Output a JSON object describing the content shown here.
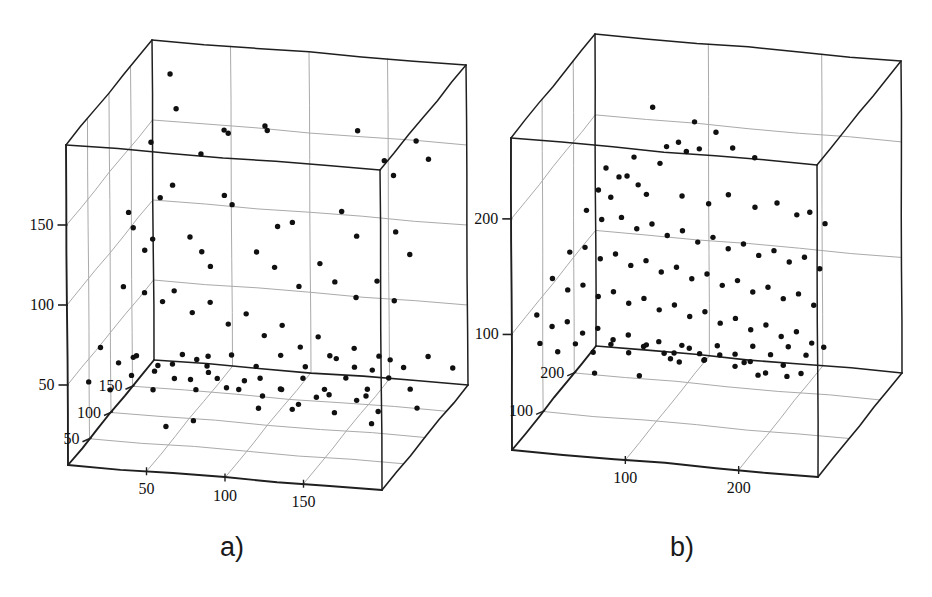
{
  "figure": {
    "background": "#ffffff",
    "ink": "#1f1f1f",
    "grid_color": "#aaaaaa",
    "point_color": "#101010",
    "width": 932,
    "height": 597
  },
  "panels": [
    {
      "id": "panel-a",
      "caption": "a)",
      "caption_pos": {
        "x": 232,
        "y": 556
      },
      "geometry": {
        "origin": {
          "x": 68,
          "y": 465
        },
        "x_axis_end": {
          "x": 382,
          "y": 490
        },
        "y_axis_top": {
          "x": 66,
          "y": 145
        },
        "depth_offset": {
          "dx": 86,
          "dy": -105
        }
      },
      "axes": {
        "x": {
          "label": "",
          "ticks": [
            50,
            100,
            150
          ],
          "min": 0,
          "max": 200
        },
        "y": {
          "label": "",
          "ticks": [
            50,
            100,
            150
          ],
          "min": 0,
          "max": 200
        },
        "z": {
          "label": "",
          "ticks": [
            50,
            100,
            150
          ],
          "min": 0,
          "max": 200
        }
      }
    },
    {
      "id": "panel-b",
      "caption": "b)",
      "caption_pos": {
        "x": 682,
        "y": 556
      },
      "geometry": {
        "origin": {
          "x": 512,
          "y": 450
        },
        "x_axis_end": {
          "x": 818,
          "y": 477
        },
        "y_axis_top": {
          "x": 511,
          "y": 138
        },
        "depth_offset": {
          "dx": 84,
          "dy": -104
        }
      },
      "axes": {
        "x": {
          "label": "",
          "ticks": [
            100,
            200
          ],
          "min": 0,
          "max": 270
        },
        "y": {
          "label": "",
          "ticks": [
            100,
            200
          ],
          "min": 0,
          "max": 270
        },
        "z": {
          "label": "",
          "ticks": [
            100,
            200
          ],
          "min": 0,
          "max": 270
        }
      }
    }
  ],
  "chart_data": [
    {
      "type": "scatter",
      "panel": "a)",
      "title": "",
      "subtitle": "",
      "xlabel": "",
      "ylabel": "",
      "zlabel": "",
      "projection": "3d",
      "grid": true,
      "legend": "none",
      "xlim": [
        0,
        200
      ],
      "ylim": [
        0,
        200
      ],
      "zlim": [
        0,
        200
      ],
      "xticks": [
        50,
        100,
        150
      ],
      "yticks": [
        50,
        100,
        150
      ],
      "zticks": [
        50,
        100,
        150
      ],
      "marker": "filled-circle",
      "n_points": 110,
      "points": [
        [
          18,
          188,
          176
        ],
        [
          22,
          167,
          175
        ],
        [
          10,
          150,
          160
        ],
        [
          44,
          148,
          152
        ],
        [
          58,
          163,
          155
        ],
        [
          62,
          163,
          150
        ],
        [
          86,
          170,
          148
        ],
        [
          88,
          168,
          146
        ],
        [
          150,
          178,
          130
        ],
        [
          168,
          162,
          126
        ],
        [
          190,
          178,
          120
        ],
        [
          176,
          156,
          118
        ],
        [
          200,
          170,
          112
        ],
        [
          36,
          140,
          115
        ],
        [
          30,
          134,
          108
        ],
        [
          72,
          140,
          104
        ],
        [
          78,
          136,
          100
        ],
        [
          108,
          126,
          96
        ],
        [
          118,
          130,
          94
        ],
        [
          150,
          140,
          92
        ],
        [
          160,
          126,
          90
        ],
        [
          186,
          132,
          86
        ],
        [
          196,
          120,
          82
        ],
        [
          12,
          126,
          100
        ],
        [
          16,
          118,
          96
        ],
        [
          30,
          114,
          90
        ],
        [
          26,
          108,
          86
        ],
        [
          56,
          120,
          82
        ],
        [
          64,
          112,
          80
        ],
        [
          70,
          104,
          78
        ],
        [
          100,
          116,
          76
        ],
        [
          112,
          108,
          74
        ],
        [
          128,
          98,
          72
        ],
        [
          142,
          114,
          70
        ],
        [
          152,
          104,
          68
        ],
        [
          166,
          96,
          66
        ],
        [
          180,
          108,
          64
        ],
        [
          192,
          98,
          60
        ],
        [
          20,
          94,
          58
        ],
        [
          34,
          92,
          56
        ],
        [
          46,
          88,
          54
        ],
        [
          54,
          96,
          52
        ],
        [
          66,
          84,
          50
        ],
        [
          78,
          92,
          48
        ],
        [
          90,
          80,
          46
        ],
        [
          102,
          88,
          44
        ],
        [
          114,
          76,
          42
        ],
        [
          126,
          84,
          40
        ],
        [
          138,
          72,
          38
        ],
        [
          150,
          80,
          36
        ],
        [
          162,
          68,
          34
        ],
        [
          174,
          76,
          32
        ],
        [
          186,
          64,
          30
        ],
        [
          198,
          72,
          28
        ],
        [
          14,
          66,
          26
        ],
        [
          26,
          58,
          24
        ],
        [
          38,
          64,
          22
        ],
        [
          50,
          56,
          20
        ],
        [
          62,
          62,
          18
        ],
        [
          74,
          54,
          16
        ],
        [
          86,
          60,
          14
        ],
        [
          98,
          52,
          12
        ],
        [
          110,
          58,
          10
        ],
        [
          122,
          50,
          8
        ],
        [
          134,
          56,
          6
        ],
        [
          146,
          48,
          4
        ],
        [
          158,
          54,
          2
        ],
        [
          170,
          46,
          0
        ],
        [
          182,
          52,
          8
        ],
        [
          194,
          44,
          14
        ],
        [
          8,
          46,
          20
        ],
        [
          20,
          40,
          26
        ],
        [
          32,
          48,
          32
        ],
        [
          44,
          38,
          38
        ],
        [
          56,
          44,
          44
        ],
        [
          68,
          36,
          50
        ],
        [
          80,
          42,
          56
        ],
        [
          92,
          34,
          62
        ],
        [
          104,
          40,
          68
        ],
        [
          116,
          32,
          74
        ],
        [
          128,
          38,
          80
        ],
        [
          140,
          30,
          86
        ],
        [
          152,
          36,
          92
        ],
        [
          164,
          28,
          98
        ],
        [
          176,
          34,
          104
        ],
        [
          188,
          26,
          110
        ],
        [
          10,
          30,
          116
        ],
        [
          24,
          24,
          122
        ],
        [
          38,
          30,
          128
        ],
        [
          52,
          22,
          134
        ],
        [
          66,
          28,
          140
        ],
        [
          80,
          20,
          146
        ],
        [
          94,
          26,
          152
        ],
        [
          108,
          18,
          158
        ],
        [
          122,
          24,
          164
        ],
        [
          136,
          16,
          170
        ],
        [
          150,
          22,
          176
        ],
        [
          164,
          14,
          182
        ],
        [
          178,
          20,
          188
        ],
        [
          192,
          12,
          194
        ],
        [
          46,
          8,
          60
        ],
        [
          58,
          6,
          80
        ],
        [
          94,
          10,
          100
        ],
        [
          110,
          4,
          120
        ],
        [
          128,
          8,
          140
        ],
        [
          146,
          2,
          160
        ],
        [
          166,
          6,
          100
        ],
        [
          184,
          4,
          140
        ],
        [
          40,
          12,
          180
        ],
        [
          30,
          6,
          190
        ]
      ]
    },
    {
      "type": "scatter",
      "panel": "b)",
      "title": "",
      "subtitle": "",
      "xlabel": "",
      "ylabel": "",
      "zlabel": "",
      "projection": "3d",
      "grid": true,
      "legend": "none",
      "xlim": [
        0,
        270
      ],
      "ylim": [
        0,
        270
      ],
      "zlim": [
        0,
        270
      ],
      "xticks": [
        100,
        200
      ],
      "yticks": [
        100,
        200
      ],
      "zticks": [
        100,
        200
      ],
      "marker": "filled-circle",
      "n_points": 120,
      "points": [
        [
          70,
          236,
          200
        ],
        [
          108,
          228,
          196
        ],
        [
          128,
          222,
          192
        ],
        [
          96,
          212,
          188
        ],
        [
          86,
          208,
          186
        ],
        [
          104,
          206,
          184
        ],
        [
          116,
          210,
          182
        ],
        [
          146,
          214,
          180
        ],
        [
          166,
          208,
          178
        ],
        [
          60,
          200,
          176
        ],
        [
          84,
          198,
          172
        ],
        [
          56,
          186,
          168
        ],
        [
          38,
          192,
          166
        ],
        [
          50,
          186,
          164
        ],
        [
          68,
          182,
          160
        ],
        [
          34,
          176,
          156
        ],
        [
          46,
          172,
          152
        ],
        [
          78,
          178,
          150
        ],
        [
          110,
          180,
          148
        ],
        [
          134,
          176,
          146
        ],
        [
          152,
          186,
          144
        ],
        [
          176,
          178,
          142
        ],
        [
          196,
          184,
          140
        ],
        [
          214,
          176,
          138
        ],
        [
          226,
          180,
          136
        ],
        [
          240,
          172,
          134
        ],
        [
          30,
          166,
          132
        ],
        [
          44,
          160,
          130
        ],
        [
          62,
          164,
          128
        ],
        [
          76,
          156,
          126
        ],
        [
          90,
          162,
          124
        ],
        [
          104,
          154,
          122
        ],
        [
          118,
          160,
          120
        ],
        [
          132,
          152,
          118
        ],
        [
          146,
          158,
          116
        ],
        [
          160,
          150,
          114
        ],
        [
          174,
          156,
          112
        ],
        [
          188,
          148,
          110
        ],
        [
          202,
          154,
          108
        ],
        [
          216,
          146,
          106
        ],
        [
          230,
          152,
          104
        ],
        [
          244,
          144,
          102
        ],
        [
          24,
          140,
          100
        ],
        [
          38,
          146,
          98
        ],
        [
          52,
          138,
          96
        ],
        [
          66,
          144,
          94
        ],
        [
          80,
          136,
          92
        ],
        [
          94,
          142,
          90
        ],
        [
          108,
          134,
          88
        ],
        [
          122,
          140,
          86
        ],
        [
          136,
          132,
          84
        ],
        [
          150,
          138,
          82
        ],
        [
          164,
          130,
          80
        ],
        [
          178,
          136,
          78
        ],
        [
          192,
          128,
          76
        ],
        [
          206,
          134,
          74
        ],
        [
          220,
          126,
          72
        ],
        [
          234,
          132,
          70
        ],
        [
          248,
          124,
          68
        ],
        [
          18,
          128,
          66
        ],
        [
          32,
          120,
          64
        ],
        [
          46,
          126,
          62
        ],
        [
          60,
          118,
          60
        ],
        [
          74,
          124,
          58
        ],
        [
          88,
          116,
          56
        ],
        [
          102,
          122,
          54
        ],
        [
          116,
          114,
          52
        ],
        [
          130,
          120,
          50
        ],
        [
          144,
          112,
          48
        ],
        [
          158,
          118,
          46
        ],
        [
          172,
          110,
          44
        ],
        [
          186,
          116,
          42
        ],
        [
          200,
          108,
          40
        ],
        [
          214,
          114,
          38
        ],
        [
          228,
          106,
          36
        ],
        [
          242,
          112,
          34
        ],
        [
          256,
          104,
          32
        ],
        [
          14,
          108,
          30
        ],
        [
          28,
          100,
          28
        ],
        [
          42,
          106,
          26
        ],
        [
          56,
          98,
          24
        ],
        [
          70,
          104,
          22
        ],
        [
          84,
          96,
          20
        ],
        [
          98,
          102,
          18
        ],
        [
          112,
          94,
          16
        ],
        [
          126,
          100,
          14
        ],
        [
          140,
          92,
          12
        ],
        [
          154,
          98,
          10
        ],
        [
          168,
          90,
          8
        ],
        [
          182,
          96,
          6
        ],
        [
          196,
          88,
          4
        ],
        [
          210,
          94,
          2
        ],
        [
          224,
          86,
          0
        ],
        [
          238,
          92,
          6
        ],
        [
          252,
          84,
          12
        ],
        [
          20,
          88,
          18
        ],
        [
          34,
          80,
          24
        ],
        [
          48,
          86,
          30
        ],
        [
          62,
          78,
          36
        ],
        [
          76,
          84,
          42
        ],
        [
          90,
          76,
          48
        ],
        [
          104,
          82,
          54
        ],
        [
          118,
          74,
          60
        ],
        [
          132,
          80,
          66
        ],
        [
          146,
          72,
          72
        ],
        [
          160,
          78,
          78
        ],
        [
          174,
          70,
          84
        ],
        [
          188,
          76,
          90
        ],
        [
          202,
          68,
          96
        ],
        [
          216,
          74,
          102
        ],
        [
          230,
          66,
          108
        ],
        [
          244,
          72,
          114
        ],
        [
          40,
          30,
          120
        ],
        [
          74,
          24,
          140
        ],
        [
          96,
          34,
          160
        ],
        [
          120,
          28,
          180
        ],
        [
          150,
          22,
          200
        ],
        [
          176,
          30,
          150
        ],
        [
          196,
          24,
          170
        ],
        [
          90,
          14,
          210
        ]
      ]
    }
  ]
}
